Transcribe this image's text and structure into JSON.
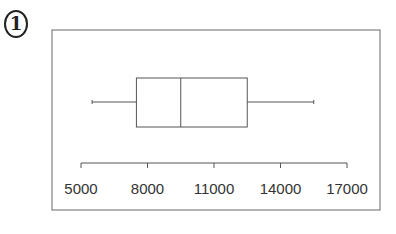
{
  "problem_number": "1",
  "chart_data": {
    "type": "boxplot",
    "title": "",
    "xlabel": "",
    "ylabel": "",
    "orientation": "horizontal",
    "xlim": [
      5000,
      17000
    ],
    "ticks": [
      5000,
      8000,
      11000,
      14000,
      17000
    ],
    "tick_labels": [
      "5000",
      "8000",
      "11000",
      "14000",
      "17000"
    ],
    "grid": false,
    "legend": null,
    "box": {
      "min": 5500,
      "q1": 7500,
      "median": 9500,
      "q3": 12500,
      "max": 15500
    }
  },
  "colors": {
    "line": "#555555",
    "frame": "#666666",
    "text": "#333333"
  }
}
